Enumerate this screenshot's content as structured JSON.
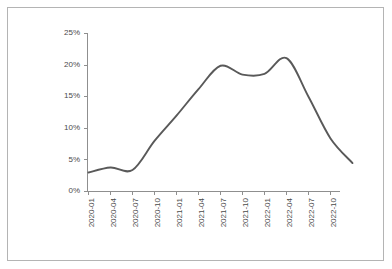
{
  "frame": {
    "border_color": "#b4b4b4",
    "background": "#ffffff"
  },
  "chart_data": {
    "type": "line",
    "title": "",
    "subtitle": "",
    "xlabel": "",
    "ylabel": "",
    "legend": [],
    "legend_position": "none",
    "grid": false,
    "line_color": "#595959",
    "axis_color": "#8f8f8f",
    "ylim": [
      0,
      25
    ],
    "y_tick_labels": [
      "0%",
      "5%",
      "10%",
      "15%",
      "20%",
      "25%"
    ],
    "y_tick_values": [
      0,
      5,
      10,
      15,
      20,
      25
    ],
    "y_unit": "%",
    "categories": [
      "2020-01",
      "2020-04",
      "2020-07",
      "2020-10",
      "2021-01",
      "2021-04",
      "2021-07",
      "2021-10",
      "2022-01",
      "2022-04",
      "2022-07",
      "2022-10"
    ],
    "x_tick_labels": [
      "2020-01",
      "2020-04",
      "2020-07",
      "2020-10",
      "2021-01",
      "2021-04",
      "2021-07",
      "2021-10",
      "2022-01",
      "2022-04",
      "2022-07",
      "2022-10"
    ],
    "x_tick_rotation": -90,
    "values": [
      3.0,
      3.8,
      3.4,
      8.0,
      12.0,
      16.2,
      19.9,
      18.5,
      18.6,
      21.1,
      15.0,
      8.4
    ],
    "values_end": 4.5,
    "annotations": [
      {
        "label": "first-peak",
        "x": "2021-07",
        "y": 20.0
      },
      {
        "label": "local-dip",
        "x": "2021-12",
        "y": 18.3
      },
      {
        "label": "second-peak",
        "x": "2022-04",
        "y": 21.1
      },
      {
        "label": "series-end",
        "x": "2023-01",
        "y": 4.5
      }
    ]
  }
}
